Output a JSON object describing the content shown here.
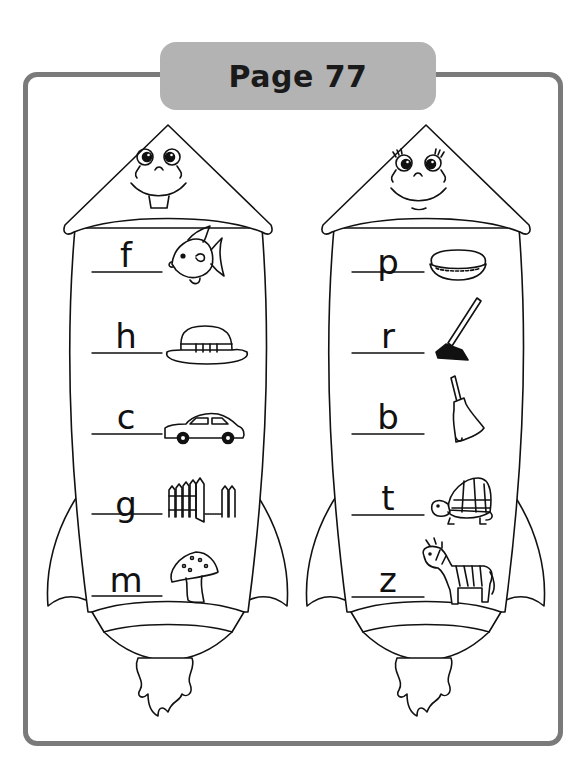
{
  "page": {
    "title": "Page 77"
  },
  "rockets": [
    {
      "side": "left",
      "face": "boy",
      "items": [
        {
          "letter": "f",
          "picture": "fish"
        },
        {
          "letter": "h",
          "picture": "hat"
        },
        {
          "letter": "c",
          "picture": "car"
        },
        {
          "letter": "g",
          "picture": "gate"
        },
        {
          "letter": "m",
          "picture": "mushroom"
        }
      ]
    },
    {
      "side": "right",
      "face": "girl",
      "items": [
        {
          "letter": "p",
          "picture": "pie"
        },
        {
          "letter": "r",
          "picture": "rake"
        },
        {
          "letter": "b",
          "picture": "bell"
        },
        {
          "letter": "t",
          "picture": "turtle"
        },
        {
          "letter": "z",
          "picture": "zebra"
        }
      ]
    }
  ],
  "colors": {
    "frame": "#7a7a7a",
    "tab": "#b3b3b3",
    "ink": "#111111"
  }
}
